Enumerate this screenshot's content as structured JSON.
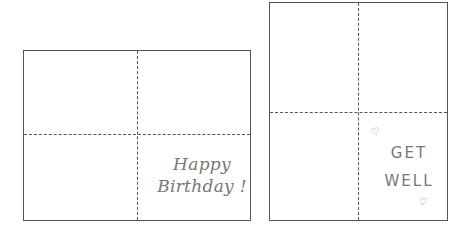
{
  "cards": [
    {
      "id": "birthday-card",
      "orientation": "landscape",
      "folds": [
        "vertical-center",
        "horizontal-center"
      ],
      "message_lines": [
        "Happy",
        "Birthday !"
      ],
      "message_panel": "bottom-right"
    },
    {
      "id": "get-well-card",
      "orientation": "portrait",
      "folds": [
        "vertical-center",
        "horizontal-center"
      ],
      "message_lines": [
        "GET",
        "WELL"
      ],
      "message_panel": "bottom-right",
      "decorations": [
        "heart",
        "heart"
      ]
    }
  ],
  "icons": {
    "heart": "♡"
  },
  "colors": {
    "line": "#555555",
    "text": "#777777"
  }
}
